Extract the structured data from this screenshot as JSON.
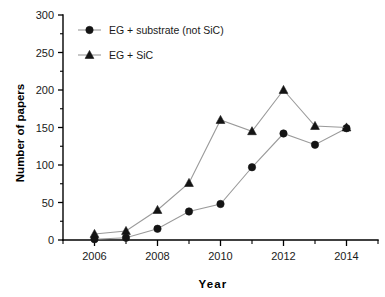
{
  "chart_data": {
    "type": "line",
    "title": "",
    "xlabel": "Year",
    "ylabel": "Number of papers",
    "x": [
      2006,
      2007,
      2008,
      2009,
      2010,
      2011,
      2012,
      2013,
      2014
    ],
    "xlim": [
      2005,
      2015
    ],
    "ylim": [
      0,
      300
    ],
    "xticks": [
      2006,
      2008,
      2010,
      2012,
      2014
    ],
    "xtick_labels": [
      "2006",
      "2008",
      "2010",
      "2012",
      "2014"
    ],
    "xticks_minor": [
      2005,
      2007,
      2009,
      2011,
      2013,
      2015
    ],
    "yticks": [
      0,
      50,
      100,
      150,
      200,
      250,
      300
    ],
    "ytick_labels": [
      "0",
      "50",
      "100",
      "150",
      "200",
      "250",
      "300"
    ],
    "yticks_minor": [
      25,
      75,
      125,
      175,
      225,
      275
    ],
    "grid": false,
    "legend_position": "top-left",
    "series": [
      {
        "name": "EG + substrate (not SiC)",
        "marker": "circle",
        "color": "#141414",
        "line_color": "#9a9a9a",
        "values": [
          1,
          3,
          15,
          38,
          48,
          97,
          142,
          127,
          149
        ]
      },
      {
        "name": "EG + SiC",
        "marker": "triangle",
        "color": "#141414",
        "line_color": "#9a9a9a",
        "values": [
          8,
          12,
          40,
          76,
          160,
          145,
          200,
          152,
          150
        ]
      }
    ]
  },
  "legend": {
    "entries": [
      {
        "label": "EG + substrate (not SiC)",
        "marker": "circle"
      },
      {
        "label": "EG + SiC",
        "marker": "triangle"
      }
    ]
  },
  "axes": {
    "x_title": "Year",
    "y_title": "Number of papers"
  }
}
